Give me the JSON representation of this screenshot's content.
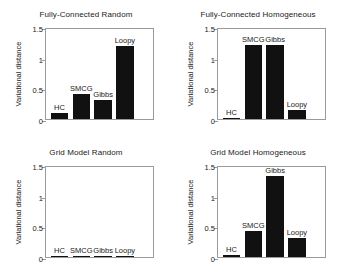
{
  "figure": {
    "background": "#ffffff",
    "bar_color": "#111111",
    "axis_color": "#9a9a9a",
    "text_color": "#1a1a1a"
  },
  "chart_data": [
    {
      "type": "bar",
      "title": "Fully-Connected Random",
      "xlabel": "",
      "ylabel": "Variational distance",
      "categories": [
        "HC",
        "SMCG",
        "Gibbs",
        "Loopy"
      ],
      "values": [
        0.09,
        0.4,
        0.31,
        1.19
      ],
      "ylim": [
        0,
        1.5
      ],
      "yticks": [
        0,
        0.5,
        1,
        1.5
      ],
      "yticklabels": [
        "0",
        "0.5",
        "1",
        "1.5"
      ],
      "grid": false,
      "legend": "none"
    },
    {
      "type": "bar",
      "title": "Fully-Connected Homogeneous",
      "xlabel": "",
      "ylabel": "Variational distance",
      "categories": [
        "HC",
        "SMCG",
        "Gibbs",
        "Loopy"
      ],
      "values": [
        0.02,
        1.21,
        1.2,
        0.15
      ],
      "ylim": [
        0,
        1.5
      ],
      "yticks": [
        0,
        0.5,
        1,
        1.5
      ],
      "yticklabels": [
        "0",
        "0.5",
        "1",
        "1.5"
      ],
      "grid": false,
      "legend": "none"
    },
    {
      "type": "bar",
      "title": "Grid Model Random",
      "xlabel": "",
      "ylabel": "Variational distance",
      "categories": [
        "HC",
        "SMCG",
        "Gibbs",
        "Loopy"
      ],
      "values": [
        0.015,
        0.015,
        0.015,
        0.015
      ],
      "ylim": [
        0,
        1.5
      ],
      "yticks": [
        0,
        0.5,
        1,
        1.5
      ],
      "yticklabels": [
        "0",
        "0.5",
        "1",
        "1.5"
      ],
      "grid": false,
      "legend": "none"
    },
    {
      "type": "bar",
      "title": "Grid Model Homogeneous",
      "xlabel": "",
      "ylabel": "Variational distance",
      "categories": [
        "HC",
        "SMCG",
        "Gibbs",
        "Loopy"
      ],
      "values": [
        0.03,
        0.43,
        1.32,
        0.31
      ],
      "ylim": [
        0,
        1.5
      ],
      "yticks": [
        0,
        0.5,
        1,
        1.5
      ],
      "yticklabels": [
        "0",
        "0.5",
        "1",
        "1.5"
      ],
      "grid": false,
      "legend": "none"
    }
  ]
}
